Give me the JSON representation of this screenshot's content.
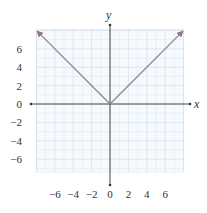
{
  "chart_data": {
    "type": "line",
    "title": "",
    "function": "y = |x|",
    "xlabel": "x",
    "ylabel": "y",
    "xlim": [
      -8,
      8
    ],
    "ylim": [
      -7.4,
      8.1
    ],
    "grid": true,
    "grid_step": 1,
    "x_ticks": [
      -6,
      -4,
      -2,
      0,
      2,
      4,
      6
    ],
    "y_ticks": [
      6,
      4,
      2,
      0,
      -2,
      -4,
      -6
    ],
    "x_tick_labels": [
      "−6",
      "−4",
      "−2",
      "0",
      "2",
      "4",
      "6"
    ],
    "y_tick_labels": [
      "6",
      "4",
      "2",
      "0",
      "−2",
      "−4",
      "−6"
    ],
    "series": [
      {
        "name": "y = |x|",
        "x": [
          -8,
          0,
          8
        ],
        "y": [
          8,
          0,
          8
        ],
        "arrows": "both-ends"
      }
    ],
    "legend": null
  },
  "colors": {
    "grid": "#dce7f1",
    "grid_major": "#c9d9e8",
    "axis": "#333333",
    "curve": "#8a7788",
    "text": "#333333"
  },
  "labels": {
    "x_axis": "x",
    "y_axis": "y"
  }
}
